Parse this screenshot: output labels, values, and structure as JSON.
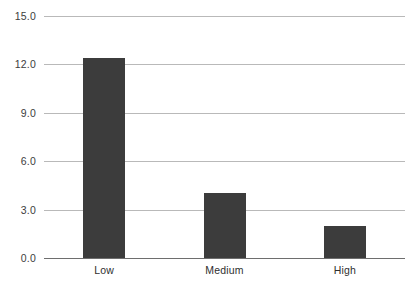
{
  "chart_data": {
    "type": "bar",
    "title": "",
    "subtitle": "",
    "xlabel": "",
    "ylabel": "",
    "categories": [
      "Low",
      "Medium",
      "High"
    ],
    "values": [
      12.4,
      4.0,
      2.0
    ],
    "ylim": [
      0.0,
      15.0
    ],
    "yticks": [
      0.0,
      3.0,
      6.0,
      9.0,
      12.0,
      15.0
    ],
    "ytick_labels": [
      "0.0",
      "3.0",
      "6.0",
      "9.0",
      "12.0",
      "15.0"
    ],
    "grid": true,
    "legend": null,
    "legend_position": "none",
    "bar_color": "#3c3c3c",
    "gridline_color": "#b9b9b9",
    "axis_color": "#6e6e6e",
    "background_color": "#ffffff"
  }
}
